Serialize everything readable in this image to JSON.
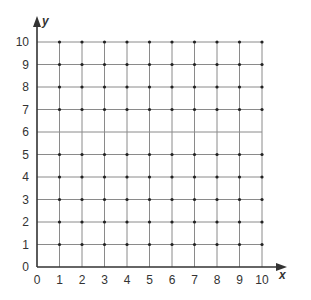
{
  "chart_data": {
    "type": "scatter",
    "title": "",
    "xlabel": "x",
    "ylabel": "y",
    "xlim": [
      0,
      10
    ],
    "ylim": [
      0,
      10
    ],
    "x_ticks": [
      "0",
      "1",
      "2",
      "3",
      "4",
      "5",
      "6",
      "7",
      "8",
      "9",
      "10"
    ],
    "y_ticks": [
      "0",
      "1",
      "2",
      "3",
      "4",
      "5",
      "6",
      "7",
      "8",
      "9",
      "10"
    ],
    "grid": true,
    "points_rows_y": [
      1,
      2,
      3,
      4,
      5,
      7,
      8,
      9,
      10
    ],
    "points_cols_x": [
      1,
      2,
      3,
      4,
      5,
      6,
      7,
      8,
      9,
      10
    ]
  },
  "colors": {
    "grid": "#8a8a8a",
    "axis": "#333333",
    "dot": "#222222"
  }
}
